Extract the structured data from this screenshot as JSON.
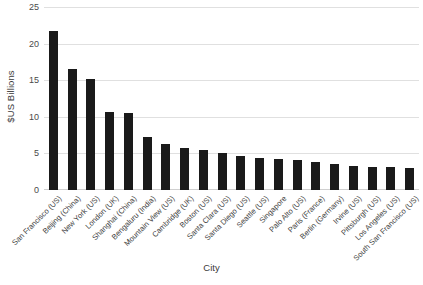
{
  "chart_data": {
    "type": "bar",
    "title": "",
    "xlabel": "City",
    "ylabel": "$US Billions",
    "ylim": [
      0,
      25
    ],
    "yticks": [
      0,
      5,
      10,
      15,
      20,
      25
    ],
    "grid": true,
    "legend": null,
    "bar_color": "#1a1a1a",
    "categories": [
      "San Francisco (US)",
      "Beijing (China)",
      "New York (US)",
      "London (UK)",
      "Shanghai (China)",
      "Bengaluru (India)",
      "Mountain View (US)",
      "Cambridge (UK)",
      "Boston (US)",
      "Santa Clara (US)",
      "Santa Diego (US)",
      "Seattle (US)",
      "Singapore",
      "Palo Alto (US)",
      "Paris (France)",
      "Berlin (Germany)",
      "Irvine (US)",
      "Pittsburgh (US)",
      "Los Angeles (US)",
      "South San Francisco (US)"
    ],
    "values": [
      21.7,
      16.6,
      15.2,
      10.6,
      10.5,
      7.2,
      6.3,
      5.8,
      5.5,
      5.1,
      4.6,
      4.4,
      4.3,
      4.1,
      3.8,
      3.6,
      3.3,
      3.2,
      3.1,
      3.0
    ]
  }
}
